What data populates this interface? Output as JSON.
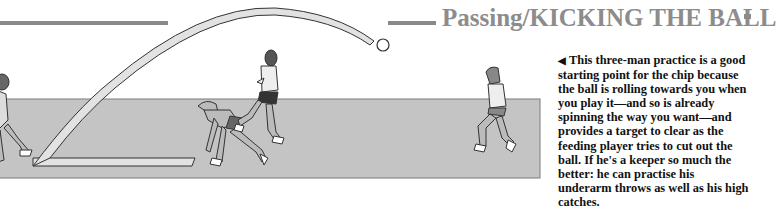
{
  "page": {
    "section_heading": "Passing/KICKING THE BALL",
    "caption": {
      "arrow_glyph": "◀",
      "text": "This three-man practice is a good starting point for the chip because the ball is rolling towards you when you play it—and so is already spinning the way you want—and provides a target to clear as the feeding player tries to cut out the ball. If he's a keeper so much the better: he can practise his underarm throws as well as his high catches."
    }
  },
  "illustration": {
    "description": "Three players: chip shot passing over a crouching feeder to a receiver; ball trajectory arc",
    "colors": {
      "field": "#c4c4c4",
      "field_edge": "#7a7a7a",
      "trajectory": "#e2e2e2",
      "outline": "#333333",
      "heading_gray": "#8c8c8c"
    }
  }
}
